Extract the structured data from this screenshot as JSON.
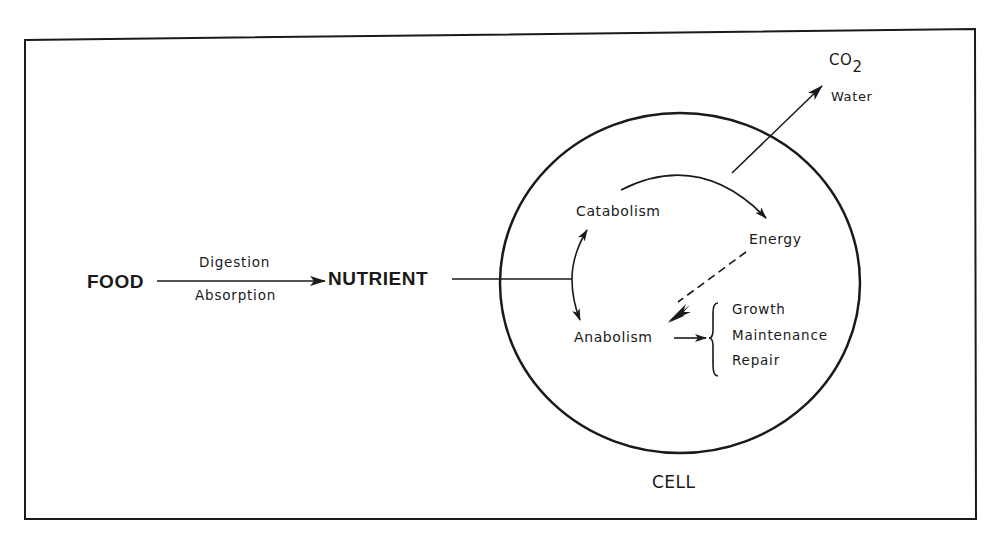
{
  "diagram": {
    "nodes": {
      "food": "FOOD",
      "nutrient": "NUTRIENT",
      "cell": "CELL",
      "catabolism": "Catabolism",
      "anabolism": "Anabolism",
      "energy": "Energy",
      "co2_main": "CO",
      "co2_sub": "2",
      "water": "Water"
    },
    "edges": {
      "food_to_nutrient_top": "Digestion",
      "food_to_nutrient_bottom": "Absorption"
    },
    "outcomes": [
      "Growth",
      "Maintenance",
      "Repair"
    ],
    "connections": [
      {
        "from": "FOOD",
        "to": "NUTRIENT",
        "style": "solid-arrow",
        "labels": [
          "Digestion",
          "Absorption"
        ]
      },
      {
        "from": "NUTRIENT",
        "to": "Catabolism/Anabolism",
        "style": "solid-line-branching-arrows"
      },
      {
        "from": "Catabolism",
        "to": "Energy",
        "style": "curved-arrow"
      },
      {
        "from": "Catabolism",
        "to": "CO2 / Water",
        "style": "solid-arrow"
      },
      {
        "from": "Energy",
        "to": "Anabolism",
        "style": "dashed-arrow"
      },
      {
        "from": "Anabolism",
        "to": "Growth/Maintenance/Repair",
        "style": "solid-arrow"
      }
    ],
    "colors": {
      "ink": "#1a1a1a",
      "background": "#ffffff"
    }
  }
}
